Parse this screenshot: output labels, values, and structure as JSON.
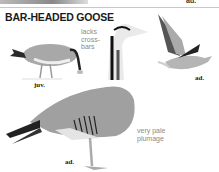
{
  "page": {
    "title": "BAR-HEADED GOOSE",
    "top_label": "ad."
  },
  "annotations": {
    "juv_note": [
      "lacks",
      "cross-",
      "bars"
    ],
    "adult_note": [
      "very pale",
      "plumage"
    ]
  },
  "figures": [
    {
      "id": "juvenile",
      "label": "juv."
    },
    {
      "id": "flying-adult",
      "label": "ad."
    },
    {
      "id": "standing-adult",
      "label": "ad."
    }
  ],
  "colors": {
    "text": "#1a1a1a",
    "note": "#8a8a8a",
    "bird_gray": "#9a9a9a",
    "bird_dark": "#1e1e1e"
  }
}
